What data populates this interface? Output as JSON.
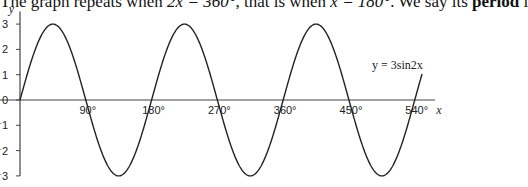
{
  "text": {
    "prefix": "The graph repeats when ",
    "expr1": "2x = 360°",
    "middle": ", that is when ",
    "expr2": "x = 180°",
    "suffix": ". We say its ",
    "bold": "period",
    "tail": " i"
  },
  "chart_data": {
    "type": "line",
    "function": "y = 3 sin 2x",
    "title": "",
    "xlabel": "x",
    "ylabel": "y",
    "x_ticks": [
      "90°",
      "180°",
      "270°",
      "360°",
      "450°",
      "540°"
    ],
    "y_ticks": [
      "-3",
      "-2",
      "-1",
      "0",
      "1",
      "2",
      "3"
    ],
    "xlim": [
      0,
      550
    ],
    "ylim": [
      -3,
      3
    ],
    "amplitude": 3,
    "period_degrees": 180,
    "series": [
      {
        "name": "y = 3sin2x",
        "x": [
          0,
          45,
          90,
          135,
          180,
          225,
          270,
          315,
          360,
          405,
          450,
          495,
          540,
          550
        ],
        "y": [
          0,
          3,
          0,
          -3,
          0,
          3,
          0,
          -3,
          0,
          3,
          0,
          -3,
          0,
          1.03
        ]
      }
    ],
    "annotations": [
      {
        "text": "y = 3sin2x",
        "near_x": 510,
        "near_y": 2.4
      }
    ],
    "grid": false
  }
}
